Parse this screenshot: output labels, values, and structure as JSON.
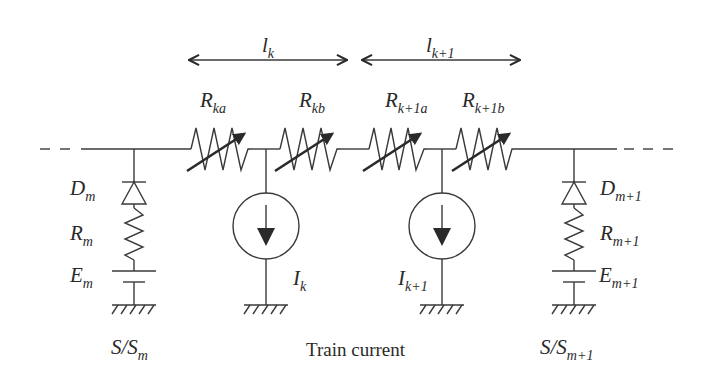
{
  "diagram": {
    "colors": {
      "stroke": "#3a3a3a",
      "text": "#2a2a2a",
      "background": "#ffffff"
    },
    "spans": [
      {
        "id": "lk",
        "symbol": "l",
        "subscript": "k"
      },
      {
        "id": "lk1",
        "symbol": "l",
        "subscript": "k+1"
      }
    ],
    "resistors": [
      {
        "id": "Rka",
        "symbol": "R",
        "subscript": "ka",
        "variable": true
      },
      {
        "id": "Rkb",
        "symbol": "R",
        "subscript": "kb",
        "variable": true
      },
      {
        "id": "Rk1a",
        "symbol": "R",
        "subscript": "k+1a",
        "variable": true
      },
      {
        "id": "Rk1b",
        "symbol": "R",
        "subscript": "k+1b",
        "variable": true
      }
    ],
    "substations": [
      {
        "id": "m",
        "diode": {
          "symbol": "D",
          "subscript": "m"
        },
        "resistor": {
          "symbol": "R",
          "subscript": "m"
        },
        "source": {
          "symbol": "E",
          "subscript": "m"
        },
        "caption": {
          "prefix": "S/S",
          "subscript": "m"
        }
      },
      {
        "id": "m1",
        "diode": {
          "symbol": "D",
          "subscript": "m+1"
        },
        "resistor": {
          "symbol": "R",
          "subscript": "m+1"
        },
        "source": {
          "symbol": "E",
          "subscript": "m+1"
        },
        "caption": {
          "prefix": "S/S",
          "subscript": "m+1"
        }
      }
    ],
    "current_sources": [
      {
        "id": "Ik",
        "symbol": "I",
        "subscript": "k"
      },
      {
        "id": "Ik1",
        "symbol": "I",
        "subscript": "k+1"
      }
    ],
    "caption_center": "Train current"
  }
}
